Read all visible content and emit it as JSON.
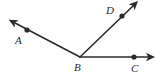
{
  "figure": {
    "kind": "geometry-ray-diagram",
    "background_color": "#ffffff",
    "stroke_color": "#2b2b2b",
    "label_color": "#2b2b2b",
    "width": 155,
    "height": 78,
    "vertex": {
      "name": "B",
      "label": "B",
      "x": 80,
      "y": 57,
      "label_x": 74,
      "label_y": 71,
      "has_dot": false
    },
    "rays": [
      {
        "name": "ray-ba",
        "label": "A",
        "from_x": 80,
        "from_y": 57,
        "to_x": 15,
        "to_y": 23,
        "dot_x": 27,
        "dot_y": 30,
        "dot_r": 2.6,
        "label_x": 15,
        "label_y": 44,
        "arrow": true
      },
      {
        "name": "ray-bd",
        "label": "D",
        "from_x": 80,
        "from_y": 57,
        "to_x": 133,
        "to_y": 6,
        "dot_x": 122,
        "dot_y": 16,
        "dot_r": 2.6,
        "label_x": 106,
        "label_y": 14,
        "arrow": true
      },
      {
        "name": "ray-bc",
        "label": "C",
        "from_x": 80,
        "from_y": 57,
        "to_x": 148,
        "to_y": 57,
        "dot_x": 134,
        "dot_y": 57,
        "dot_r": 2.6,
        "label_x": 131,
        "label_y": 72,
        "arrow": true
      }
    ],
    "labels": {
      "a": "A",
      "b": "B",
      "c": "C",
      "d": "D"
    },
    "stroke_width": 1.6
  }
}
